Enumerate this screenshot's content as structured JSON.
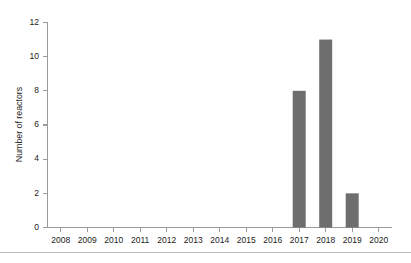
{
  "chart_data": {
    "type": "bar",
    "title": "",
    "xlabel": "",
    "ylabel": "Number of reactors",
    "categories": [
      "2008",
      "2009",
      "2010",
      "2011",
      "2012",
      "2013",
      "2014",
      "2015",
      "2016",
      "2017",
      "2018",
      "2019",
      "2020"
    ],
    "values": [
      0,
      0,
      0,
      0,
      0,
      0,
      0,
      0,
      0,
      8,
      11,
      2,
      0
    ],
    "ylim": [
      0,
      12
    ],
    "yticks": [
      0,
      2,
      4,
      6,
      8,
      10,
      12
    ],
    "ytick_labels": [
      "0",
      "2",
      "4",
      "6",
      "8",
      "10",
      "12"
    ],
    "grid": false,
    "legend": false,
    "bar_color": "#6e6e6e",
    "axis_color": "#9a9a9a",
    "text_color": "#1c1c1c"
  },
  "figure": {
    "background": "#ffffff",
    "footer_rule_color": "#b8b8b8"
  }
}
